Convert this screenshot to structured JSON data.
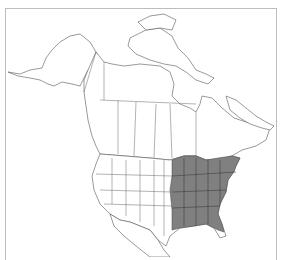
{
  "map": {
    "subject": "North America range map",
    "range_region": "Eastern United States",
    "colors": {
      "range_fill": "#808080",
      "land_fill": "#ffffff",
      "outline": "#555555",
      "frame": "#bdbdbd"
    }
  }
}
